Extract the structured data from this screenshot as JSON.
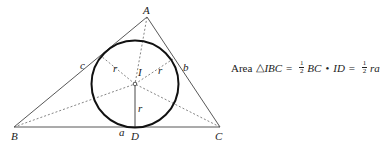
{
  "diagram": {
    "points": {
      "A": {
        "label": "A",
        "x": 147,
        "y": 17
      },
      "B": {
        "label": "B",
        "x": 14,
        "y": 127
      },
      "C": {
        "label": "C",
        "x": 220,
        "y": 127
      },
      "I": {
        "label": "I",
        "x": 135,
        "y": 84
      },
      "D": {
        "label": "D",
        "x": 135,
        "y": 127
      }
    },
    "sides": {
      "a": "a",
      "b": "b",
      "c": "c"
    },
    "radius_label": "r",
    "incircle_radius_px": 43
  },
  "formula": {
    "prefix": "Area",
    "triangle_symbol": "△",
    "triangle_name": "IBC",
    "eq1": "=",
    "frac_num": "1",
    "frac_den": "2",
    "term1": "BC",
    "dot": "•",
    "term2": "ID",
    "eq2": "=",
    "term3": "ra"
  },
  "colors": {
    "stroke": "#333333",
    "circle": "#111111",
    "text": "#222222"
  }
}
